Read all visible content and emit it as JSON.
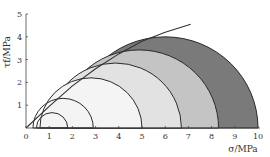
{
  "chart_data": {
    "type": "diagram",
    "title": "",
    "xlabel": "σ/MPa",
    "ylabel": "τf/MPa",
    "xlim": [
      0,
      10
    ],
    "ylim": [
      0,
      5
    ],
    "xticks": [
      "0",
      "1",
      "2",
      "3",
      "4",
      "5",
      "6",
      "7",
      "8",
      "9",
      "10"
    ],
    "yticks": [
      "1",
      "2",
      "3",
      "4",
      "5"
    ],
    "grid": false,
    "mohr_circles": [
      {
        "sigma3": 0.45,
        "sigma1": 1.8,
        "fill": "none"
      },
      {
        "sigma3": 0.3,
        "sigma1": 2.9,
        "fill": "none"
      },
      {
        "sigma3": 0.6,
        "sigma1": 5.0,
        "fill": "#f4f4f4"
      },
      {
        "sigma3": 1.0,
        "sigma1": 6.7,
        "fill": "#e2e2e2"
      },
      {
        "sigma3": 1.45,
        "sigma1": 8.3,
        "fill": "#c4c4c4"
      },
      {
        "sigma3": 2.0,
        "sigma1": 10.0,
        "fill": "#7a7a7a"
      }
    ],
    "envelope": {
      "description": "curved strength envelope tangent to Mohr circles",
      "points": [
        [
          0,
          0
        ],
        [
          1,
          0.95
        ],
        [
          2,
          1.85
        ],
        [
          3,
          2.6
        ],
        [
          4,
          3.25
        ],
        [
          5,
          3.8
        ],
        [
          6,
          4.2
        ],
        [
          7.1,
          4.55
        ]
      ]
    }
  }
}
